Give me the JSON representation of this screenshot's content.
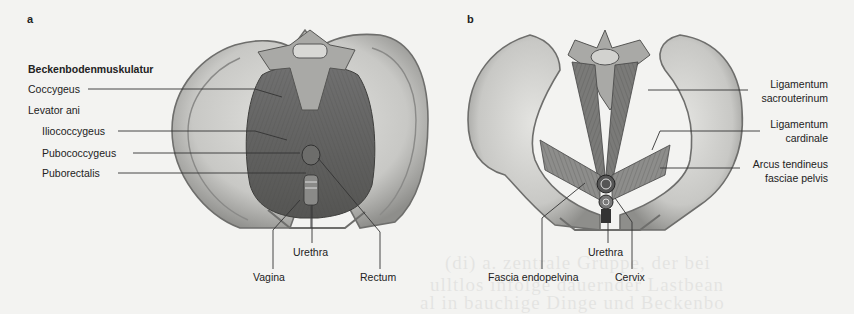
{
  "figure": {
    "panels": [
      {
        "letter": "a",
        "heading": "Beckenbodenmuskulatur",
        "labels": {
          "coccygeus": "Coccygeus",
          "levator_ani": "Levator ani",
          "iliococcygeus": "Iliococcygeus",
          "pubococcygeus": "Pubococcygeus",
          "puborectalis": "Puborectalis",
          "urethra": "Urethra",
          "vagina": "Vagina",
          "rectum": "Rectum"
        }
      },
      {
        "letter": "b",
        "labels": {
          "lig_sacrouterinum_1": "Ligamentum",
          "lig_sacrouterinum_2": "sacrouterinum",
          "lig_cardinale_1": "Ligamentum",
          "lig_cardinale_2": "cardinale",
          "arcus_1": "Arcus tendineus",
          "arcus_2": "fasciae pelvis",
          "urethra": "Urethra",
          "fascia": "Fascia endopelvina",
          "cervix": "Cervix"
        }
      }
    ],
    "background_bleed_text": [
      "(di) a. zentrale Gruppe, der bei",
      "ulltlos infolge dauernder Lastbean",
      "al in bauchige Dinge und Beckenbo"
    ],
    "colors": {
      "paper": "#f3f3f1",
      "bone_light": "#d6d6d3",
      "bone_dark": "#8a8a88",
      "muscle": "#5e5e5c",
      "ink": "#222222"
    }
  }
}
